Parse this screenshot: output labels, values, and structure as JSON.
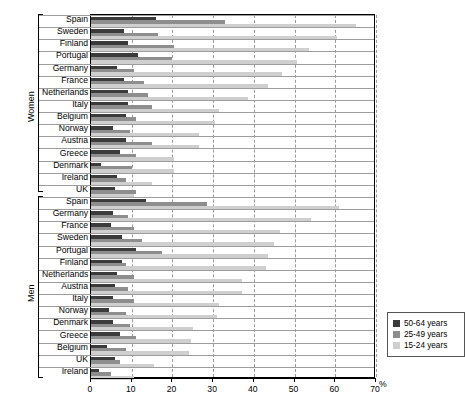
{
  "chart_data": {
    "type": "bar",
    "orientation": "horizontal",
    "title": "",
    "xlabel": "%",
    "ylabel": "",
    "xlim": [
      0,
      70
    ],
    "xticks": [
      0,
      10,
      20,
      30,
      40,
      50,
      60,
      70
    ],
    "grid": "vertical dashed gridlines at every 10%",
    "legend_position": "inside right, lower panel",
    "legend": [
      "50-64 years",
      "25-49 years",
      "15-24 years"
    ],
    "series": [
      {
        "name": "50-64 years",
        "color": "#3b3b3b"
      },
      {
        "name": "25-49 years",
        "color": "#8e8e8e"
      },
      {
        "name": "15-24 years",
        "color": "#cfcfcf"
      }
    ],
    "panels": [
      {
        "name": "Women",
        "categories": [
          "Spain",
          "Sweden",
          "Finland",
          "Portugal",
          "Germany",
          "France",
          "Netherlands",
          "Italy",
          "Belgium",
          "Norway",
          "Austria",
          "Greece",
          "Denmark",
          "Ireland",
          "UK"
        ],
        "values": {
          "50-64 years": [
            16.0,
            8.0,
            9.0,
            11.5,
            6.5,
            8.0,
            9.0,
            9.0,
            8.5,
            5.5,
            8.5,
            7.0,
            2.5,
            6.5,
            6.0
          ],
          "25-49 years": [
            33.0,
            16.5,
            20.5,
            20.0,
            10.5,
            13.0,
            14.0,
            15.0,
            11.0,
            9.5,
            15.0,
            11.0,
            10.0,
            8.5,
            11.0
          ],
          "15-24 years": [
            65.0,
            60.5,
            53.5,
            50.5,
            47.0,
            43.5,
            38.5,
            31.5,
            30.5,
            26.5,
            26.5,
            20.5,
            20.5,
            15.0,
            10.5
          ]
        }
      },
      {
        "name": "Men",
        "categories": [
          "Spain",
          "Germany",
          "France",
          "Sweden",
          "Portugal",
          "Finland",
          "Netherlands",
          "Austria",
          "Italy",
          "Norway",
          "Denmark",
          "Greece",
          "Belgium",
          "UK",
          "Ireland"
        ],
        "values": {
          "50-64 years": [
            13.5,
            5.5,
            5.0,
            7.5,
            11.0,
            7.5,
            6.5,
            6.0,
            5.5,
            4.5,
            5.5,
            7.0,
            4.0,
            6.0,
            2.0
          ],
          "25-49 years": [
            28.5,
            9.0,
            10.5,
            12.5,
            17.5,
            8.5,
            10.5,
            9.0,
            10.5,
            8.5,
            9.5,
            11.0,
            8.5,
            7.0,
            5.0
          ],
          "15-24 years": [
            61.0,
            54.0,
            46.5,
            45.0,
            43.5,
            43.0,
            37.0,
            37.0,
            31.5,
            31.0,
            25.0,
            24.5,
            24.0,
            15.5,
            10.5
          ]
        }
      }
    ]
  },
  "axis": {
    "unit": "%",
    "tick_labels": [
      "0",
      "10",
      "20",
      "30",
      "40",
      "50",
      "60",
      "70"
    ]
  },
  "groups": {
    "women": "Women",
    "men": "Men"
  },
  "legend": {
    "items": [
      {
        "label": "50-64 years",
        "color": "#3b3b3b"
      },
      {
        "label": "25-49 years",
        "color": "#8e8e8e"
      },
      {
        "label": "15-24 years",
        "color": "#cfcfcf"
      }
    ]
  }
}
